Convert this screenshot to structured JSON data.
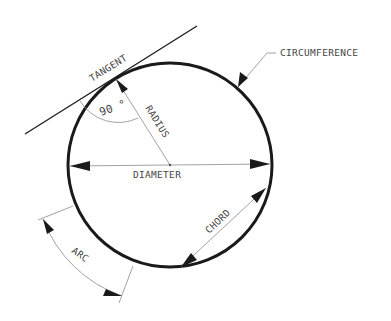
{
  "diagram": {
    "labels": {
      "tangent": "TANGENT",
      "circumference": "CIRCUMFERENCE",
      "radius": "RADIUS",
      "angle": "90 °",
      "diameter": "DIAMETER",
      "chord": "CHORD",
      "arc": "ARC"
    },
    "geometry": {
      "center": [
        170,
        165
      ],
      "radius": 102
    },
    "colors": {
      "circle": "#1a1a1a",
      "dimension_lines": "#8a8a8a",
      "text": "#444444",
      "background": "#ffffff"
    }
  }
}
